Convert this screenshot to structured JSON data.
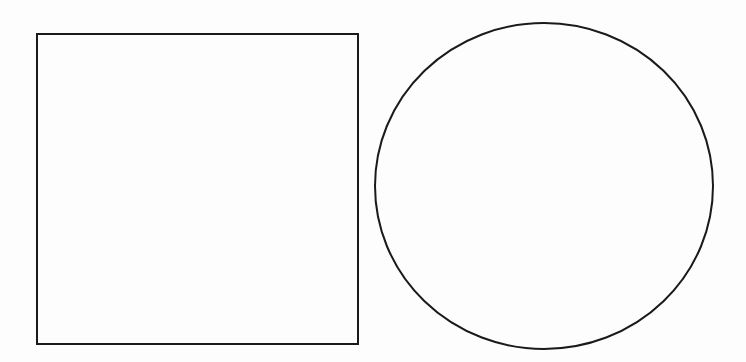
{
  "canvas": {
    "width": 746,
    "height": 362,
    "background": "#fdfdfd"
  },
  "shapes": [
    {
      "type": "square",
      "x": 37,
      "y": 34,
      "width": 321,
      "height": 310,
      "stroke": "#1a1a1a",
      "stroke_width": 2,
      "fill": "none"
    },
    {
      "type": "circle",
      "cx": 544,
      "cy": 186,
      "rx": 169,
      "ry": 163,
      "stroke": "#1a1a1a",
      "stroke_width": 2,
      "fill": "none"
    }
  ]
}
